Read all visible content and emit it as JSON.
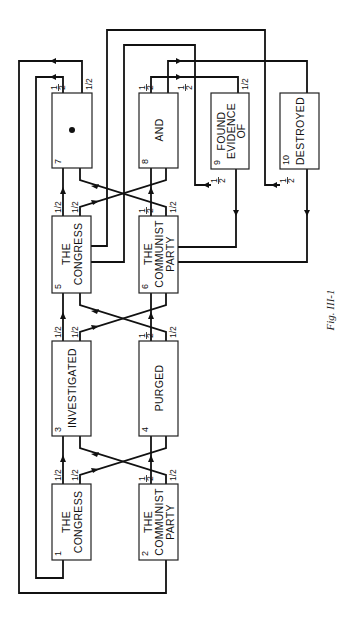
{
  "figure": {
    "caption": "Fig. III-1",
    "orientation": "rotated-90-ccw"
  },
  "boxes": [
    {
      "id": 1,
      "number": "1",
      "lines": [
        "THE",
        "CONGRESS"
      ]
    },
    {
      "id": 2,
      "number": "2",
      "lines": [
        "THE",
        "COMMUNIST",
        "PARTY"
      ]
    },
    {
      "id": 3,
      "number": "3",
      "lines": [
        "INVESTIGATED"
      ]
    },
    {
      "id": 4,
      "number": "4",
      "lines": [
        "PURGED"
      ]
    },
    {
      "id": 5,
      "number": "5",
      "lines": [
        "THE",
        "CONGRESS"
      ]
    },
    {
      "id": 6,
      "number": "6",
      "lines": [
        "THE",
        "COMMUNIST",
        "PARTY"
      ]
    },
    {
      "id": 7,
      "number": "7",
      "lines": [
        "•"
      ]
    },
    {
      "id": 8,
      "number": "8",
      "lines": [
        "AND"
      ]
    },
    {
      "id": 9,
      "number": "9",
      "lines": [
        "FOUND",
        "EVIDENCE",
        "OF"
      ]
    },
    {
      "id": 10,
      "number": "10",
      "lines": [
        "DESTROYED"
      ]
    }
  ],
  "labels": {
    "half_slash": "1/2",
    "half_num": "1",
    "half_den": "2"
  }
}
